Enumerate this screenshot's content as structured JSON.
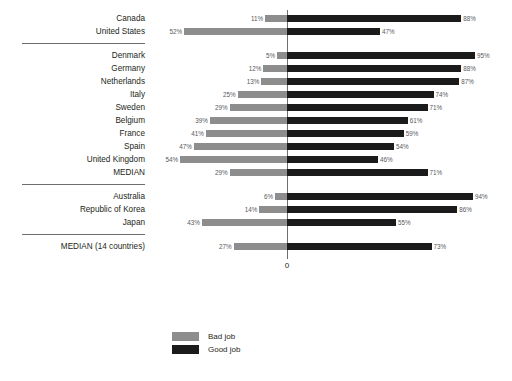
{
  "chart_data": {
    "type": "bar",
    "subtype": "diverging-stacked-horizontal",
    "title": "",
    "xlabel": "",
    "ylabel": "",
    "axis_zero_label": "0",
    "xlim": [
      -60,
      100
    ],
    "grid": false,
    "legend_position": "bottom-left",
    "value_suffix": "%",
    "series": [
      {
        "name": "Bad job",
        "color": "#8d8d8d",
        "direction": "left"
      },
      {
        "name": "Good job",
        "color": "#1b1b1b",
        "direction": "right"
      }
    ],
    "groups": [
      {
        "name": "North America",
        "rows": [
          {
            "label": "Canada",
            "bad": 11,
            "good": 88,
            "bad_text": "11%",
            "good_text": "88%"
          },
          {
            "label": "United States",
            "bad": 52,
            "good": 47,
            "bad_text": "52%",
            "good_text": "47%"
          }
        ]
      },
      {
        "name": "Europe",
        "rows": [
          {
            "label": "Denmark",
            "bad": 5,
            "good": 95,
            "bad_text": "5%",
            "good_text": "95%"
          },
          {
            "label": "Germany",
            "bad": 12,
            "good": 88,
            "bad_text": "12%",
            "good_text": "88%"
          },
          {
            "label": "Netherlands",
            "bad": 13,
            "good": 87,
            "bad_text": "13%",
            "good_text": "87%"
          },
          {
            "label": "Italy",
            "bad": 25,
            "good": 74,
            "bad_text": "25%",
            "good_text": "74%"
          },
          {
            "label": "Sweden",
            "bad": 29,
            "good": 71,
            "bad_text": "29%",
            "good_text": "71%"
          },
          {
            "label": "Belgium",
            "bad": 39,
            "good": 61,
            "bad_text": "39%",
            "good_text": "61%"
          },
          {
            "label": "France",
            "bad": 41,
            "good": 59,
            "bad_text": "41%",
            "good_text": "59%"
          },
          {
            "label": "Spain",
            "bad": 47,
            "good": 54,
            "bad_text": "47%",
            "good_text": "54%"
          },
          {
            "label": "United Kingdom",
            "bad": 54,
            "good": 46,
            "bad_text": "54%",
            "good_text": "46%"
          },
          {
            "label": "MEDIAN",
            "bad": 29,
            "good": 71,
            "bad_text": "29%",
            "good_text": "71%"
          }
        ]
      },
      {
        "name": "Asia-Pacific",
        "rows": [
          {
            "label": "Australia",
            "bad": 6,
            "good": 94,
            "bad_text": "6%",
            "good_text": "94%"
          },
          {
            "label": "Republic of Korea",
            "bad": 14,
            "good": 86,
            "bad_text": "14%",
            "good_text": "86%"
          },
          {
            "label": "Japan",
            "bad": 43,
            "good": 55,
            "bad_text": "43%",
            "good_text": "55%"
          }
        ]
      },
      {
        "name": "Overall",
        "rows": [
          {
            "label": "MEDIAN (14 countries)",
            "bad": 27,
            "good": 73,
            "bad_text": "27%",
            "good_text": "73%"
          }
        ]
      }
    ]
  },
  "legend": {
    "items": [
      {
        "label": "Bad job",
        "color": "#8d8d8d"
      },
      {
        "label": "Good job",
        "color": "#1b1b1b"
      }
    ]
  }
}
